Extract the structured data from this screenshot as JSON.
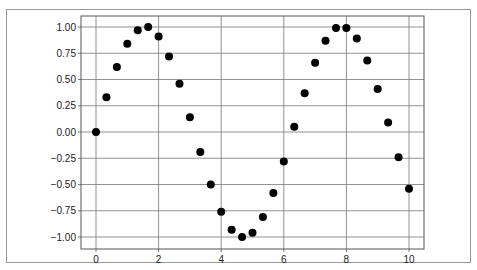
{
  "chart_data": {
    "type": "scatter",
    "title": "",
    "xlabel": "",
    "ylabel": "",
    "xlim": [
      -0.5,
      10.5
    ],
    "ylim": [
      -1.1,
      1.1
    ],
    "grid": true,
    "legend": null,
    "x_ticks": [
      "0",
      "2",
      "4",
      "6",
      "8",
      "10"
    ],
    "y_ticks": [
      "1.00",
      "0.75",
      "0.50",
      "0.25",
      "0.00",
      "-0.25",
      "-0.50",
      "-0.75",
      "-1.00"
    ],
    "marker_color": "#000000",
    "series": [
      {
        "name": "sin(x)",
        "x": [
          0,
          0.333,
          0.667,
          1.0,
          1.333,
          1.667,
          2.0,
          2.333,
          2.667,
          3.0,
          3.333,
          3.667,
          4.0,
          4.333,
          4.667,
          5.0,
          5.333,
          5.667,
          6.0,
          6.333,
          6.667,
          7.0,
          7.333,
          7.667,
          8.0,
          8.333,
          8.667,
          9.0,
          9.333,
          9.667,
          10.0
        ],
        "y": [
          0.0,
          0.33,
          0.62,
          0.84,
          0.97,
          1.0,
          0.91,
          0.72,
          0.46,
          0.14,
          -0.19,
          -0.5,
          -0.76,
          -0.93,
          -1.0,
          -0.96,
          -0.81,
          -0.58,
          -0.28,
          0.05,
          0.37,
          0.66,
          0.87,
          0.99,
          0.99,
          0.89,
          0.68,
          0.41,
          0.09,
          -0.24,
          -0.54
        ]
      }
    ]
  }
}
